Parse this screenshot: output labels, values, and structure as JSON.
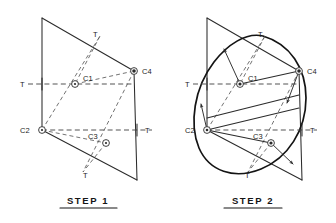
{
  "figure": {
    "ink_color": "#2b2b2b",
    "dash_color": "#4a4a4a",
    "ellipse_color": "#141414",
    "background": "#ffffff"
  },
  "panels": [
    {
      "id": "step1",
      "caption": "STEP 1",
      "centers": [
        {
          "id": "c1",
          "label": "C1",
          "x": 75,
          "y": 84
        },
        {
          "id": "c2",
          "label": "C2",
          "x": 42,
          "y": 130
        },
        {
          "id": "c3",
          "label": "C3",
          "x": 106,
          "y": 143
        },
        {
          "id": "c4",
          "label": "C4",
          "x": 134,
          "y": 71
        }
      ],
      "tangent_marks": [
        {
          "id": "t-top",
          "label": "T",
          "x": 95,
          "y": 36
        },
        {
          "id": "t-left",
          "label": "T",
          "x": 22,
          "y": 79
        },
        {
          "id": "t-right",
          "label": "T",
          "x": 148,
          "y": 140
        },
        {
          "id": "t-bottom",
          "label": "T",
          "x": 86,
          "y": 172
        }
      ],
      "parallelogram": [
        {
          "x": 42,
          "y": 18
        },
        {
          "x": 134,
          "y": 71
        },
        {
          "x": 137,
          "y": 180
        },
        {
          "x": 42,
          "y": 130
        }
      ]
    },
    {
      "id": "step2",
      "caption": "STEP 2",
      "centers": [
        {
          "id": "c1",
          "label": "C1",
          "x": 240,
          "y": 84
        },
        {
          "id": "c2",
          "label": "C2",
          "x": 207,
          "y": 130
        },
        {
          "id": "c3",
          "label": "C3",
          "x": 271,
          "y": 143
        },
        {
          "id": "c4",
          "label": "C4",
          "x": 299,
          "y": 71
        }
      ],
      "tangent_marks": [
        {
          "id": "t-top",
          "label": "T",
          "x": 260,
          "y": 36
        },
        {
          "id": "t-left",
          "label": "T",
          "x": 187,
          "y": 79
        },
        {
          "id": "t-right",
          "label": "T",
          "x": 313,
          "y": 140
        },
        {
          "id": "t-bottom",
          "label": "T",
          "x": 251,
          "y": 172
        }
      ],
      "parallelogram": [
        {
          "x": 207,
          "y": 18
        },
        {
          "x": 299,
          "y": 71
        },
        {
          "x": 302,
          "y": 180
        },
        {
          "x": 207,
          "y": 130
        }
      ],
      "has_ellipse": true,
      "radius_arrows": 4
    }
  ]
}
